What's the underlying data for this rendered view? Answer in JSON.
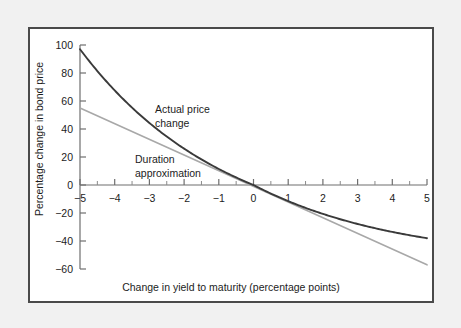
{
  "figure": {
    "background_color": "#f1f1f1",
    "panel_background": "#ffffff",
    "panel_border_color": "#4a4a4a"
  },
  "chart_data": {
    "type": "line",
    "title": "",
    "xlabel": "Change in yield to maturity (percentage points)",
    "ylabel": "Percentage change in bond price",
    "xlim": [
      -5,
      5
    ],
    "ylim": [
      -60,
      100
    ],
    "grid": false,
    "legend_position": "inline-annotations",
    "xticks": [
      -5,
      -4,
      -3,
      -2,
      -1,
      0,
      1,
      2,
      3,
      4,
      5
    ],
    "xticklabels": [
      "−5",
      "−4",
      "−3",
      "−2",
      "−1",
      "0",
      "1",
      "2",
      "3",
      "4",
      "5"
    ],
    "xminorticks": [
      -4.5,
      -3.5,
      -2.5,
      -1.5,
      -0.5,
      0.5,
      1.5,
      2.5,
      3.5,
      4.5
    ],
    "yticks": [
      -60,
      -40,
      -20,
      0,
      20,
      40,
      60,
      80,
      100
    ],
    "yticklabels": [
      "−60",
      "−40",
      "−20",
      "0",
      "20",
      "40",
      "60",
      "80",
      "100"
    ],
    "x": [
      -5,
      -4.5,
      -4,
      -3.5,
      -3,
      -2.5,
      -2,
      -1.5,
      -1,
      -0.5,
      0,
      0.5,
      1,
      1.5,
      2,
      2.5,
      3,
      3.5,
      4,
      4.5,
      5
    ],
    "series": [
      {
        "name": "Actual price change",
        "color": "#3a3a3a",
        "width": 1.9,
        "values": [
          97.0,
          85.0,
          74.2,
          64.4,
          55.6,
          47.6,
          40.3,
          33.7,
          27.6,
          22.0,
          0.0,
          12.3,
          7.9,
          3.9,
          0.2,
          -3.3,
          -6.5,
          -9.4,
          -12.2,
          -14.7,
          -17.1
        ],
        "values_actual": [
          97.0,
          85.0,
          74.2,
          64.4,
          55.6,
          47.6,
          40.3,
          33.7,
          27.6,
          22.0,
          16.8,
          12.3,
          7.9,
          3.9,
          0.2,
          -3.3,
          -6.5,
          -9.4,
          -12.2,
          -14.7,
          -17.1
        ],
        "endpoint_left": 97,
        "endpoint_right": -38,
        "value_at_zero": 0
      },
      {
        "name": "Duration approximation",
        "color": "#a8a8a8",
        "width": 1.6,
        "values": [
          55.0,
          49.5,
          44.0,
          38.5,
          33.0,
          27.5,
          22.0,
          16.5,
          11.0,
          5.5,
          0.0,
          -5.7,
          -11.4,
          -17.1,
          -22.8,
          -28.5,
          -34.2,
          -39.9,
          -45.6,
          -51.3,
          -57.0
        ],
        "slope_per_unit": -11.2,
        "endpoint_left": 55,
        "endpoint_right": -57,
        "value_at_zero": 0
      }
    ],
    "annotations": [
      {
        "id": "actual-price-change",
        "lines": [
          "Actual price",
          "change"
        ],
        "x": 125,
        "y": 84
      },
      {
        "id": "duration-approximation",
        "lines": [
          "Duration",
          "approximation"
        ],
        "x": 105,
        "y": 134
      }
    ]
  }
}
